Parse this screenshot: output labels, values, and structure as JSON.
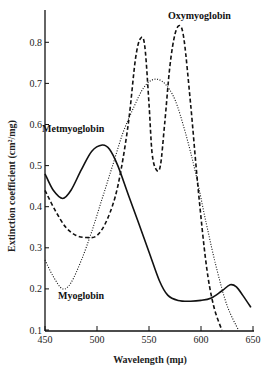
{
  "chart_data": {
    "type": "line",
    "title": "",
    "xlabel": "Wavelength (mμ)",
    "ylabel": "Extinction coefficient (cm²/mg)",
    "xlim": [
      450,
      650
    ],
    "ylim": [
      0.1,
      0.87
    ],
    "grid": false,
    "legend": "inline labels",
    "x_ticks": [
      450,
      500,
      550,
      600,
      650
    ],
    "y_ticks": [
      0.1,
      0.2,
      0.3,
      0.4,
      0.5,
      0.6,
      0.7,
      0.8
    ],
    "x_tick_labels": [
      "450",
      "500",
      "550",
      "600",
      "650"
    ],
    "y_tick_labels": [
      "0.1",
      "0.2",
      "0.3",
      "0.4",
      "0.5",
      "0.6",
      "0.7",
      "0.8"
    ],
    "series": [
      {
        "name": "Metmyoglobin",
        "style": "solid",
        "label_pos": [
          42,
          132
        ],
        "points": [
          [
            450,
            0.48
          ],
          [
            458,
            0.44
          ],
          [
            467,
            0.42
          ],
          [
            475,
            0.44
          ],
          [
            485,
            0.49
          ],
          [
            495,
            0.535
          ],
          [
            505,
            0.55
          ],
          [
            512,
            0.54
          ],
          [
            520,
            0.5
          ],
          [
            530,
            0.43
          ],
          [
            540,
            0.36
          ],
          [
            550,
            0.29
          ],
          [
            560,
            0.22
          ],
          [
            568,
            0.185
          ],
          [
            578,
            0.172
          ],
          [
            590,
            0.17
          ],
          [
            600,
            0.172
          ],
          [
            610,
            0.178
          ],
          [
            620,
            0.195
          ],
          [
            628,
            0.21
          ],
          [
            634,
            0.205
          ],
          [
            640,
            0.185
          ],
          [
            648,
            0.155
          ]
        ]
      },
      {
        "name": "Oxymyoglobin",
        "style": "dashed",
        "label_pos": [
          168,
          19
        ],
        "points": [
          [
            450,
            0.44
          ],
          [
            460,
            0.39
          ],
          [
            470,
            0.35
          ],
          [
            480,
            0.33
          ],
          [
            490,
            0.325
          ],
          [
            500,
            0.33
          ],
          [
            510,
            0.37
          ],
          [
            520,
            0.45
          ],
          [
            530,
            0.6
          ],
          [
            537,
            0.76
          ],
          [
            542,
            0.81
          ],
          [
            546,
            0.79
          ],
          [
            550,
            0.65
          ],
          [
            553,
            0.53
          ],
          [
            557,
            0.49
          ],
          [
            561,
            0.5
          ],
          [
            565,
            0.6
          ],
          [
            570,
            0.74
          ],
          [
            575,
            0.82
          ],
          [
            580,
            0.84
          ],
          [
            584,
            0.8
          ],
          [
            590,
            0.65
          ],
          [
            597,
            0.45
          ],
          [
            605,
            0.26
          ],
          [
            612,
            0.16
          ],
          [
            620,
            0.1
          ]
        ]
      },
      {
        "name": "Myoglobin",
        "style": "dotted",
        "label_pos": [
          58,
          299
        ],
        "points": [
          [
            450,
            0.27
          ],
          [
            458,
            0.23
          ],
          [
            467,
            0.2
          ],
          [
            475,
            0.215
          ],
          [
            485,
            0.27
          ],
          [
            495,
            0.34
          ],
          [
            505,
            0.42
          ],
          [
            515,
            0.5
          ],
          [
            525,
            0.58
          ],
          [
            535,
            0.64
          ],
          [
            545,
            0.69
          ],
          [
            555,
            0.71
          ],
          [
            565,
            0.7
          ],
          [
            575,
            0.66
          ],
          [
            585,
            0.58
          ],
          [
            595,
            0.48
          ],
          [
            605,
            0.36
          ],
          [
            615,
            0.25
          ],
          [
            625,
            0.16
          ],
          [
            636,
            0.1
          ]
        ]
      }
    ]
  }
}
